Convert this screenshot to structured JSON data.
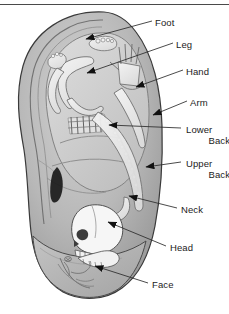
{
  "figure": {
    "top_rule_color": "#4a4a4a",
    "background_color": "#ffffff",
    "ear_fill_color": "#b9b9b9",
    "ear_outline_color": "#3a3a3a",
    "inner_fill_color": "#d6d6d6",
    "fetus_fill_color": "#ededed",
    "shadow_color": "#8e8e8e",
    "arrow_color": "#111111",
    "leader_color": "#2b2b2b",
    "text_color": "#1c1c1c"
  },
  "labels": [
    {
      "id": "foot",
      "text": "Foot",
      "x": 155,
      "y": 17,
      "two_line": false
    },
    {
      "id": "leg",
      "text": "Leg",
      "x": 176,
      "y": 39,
      "two_line": false
    },
    {
      "id": "hand",
      "text": "Hand",
      "x": 186,
      "y": 66,
      "two_line": false
    },
    {
      "id": "arm",
      "text": "Arm",
      "x": 190,
      "y": 97,
      "two_line": false
    },
    {
      "id": "lower-back",
      "line1": "Lower",
      "line2": "Back",
      "x": 186,
      "y": 124,
      "two_line": true
    },
    {
      "id": "upper-back",
      "line1": "Upper",
      "line2": "Back",
      "x": 186,
      "y": 158,
      "two_line": true
    },
    {
      "id": "neck",
      "text": "Neck",
      "x": 181,
      "y": 204,
      "two_line": false
    },
    {
      "id": "head",
      "text": "Head",
      "x": 170,
      "y": 242,
      "two_line": false
    },
    {
      "id": "face",
      "text": "Face",
      "x": 152,
      "y": 279,
      "two_line": false
    }
  ],
  "leaders": [
    {
      "id": "foot",
      "x1": 152,
      "y1": 21,
      "x2": 84,
      "y2": 39
    },
    {
      "id": "leg",
      "x1": 173,
      "y1": 43,
      "x2": 85,
      "y2": 73
    },
    {
      "id": "hand",
      "x1": 183,
      "y1": 70,
      "x2": 135,
      "y2": 87
    },
    {
      "id": "arm",
      "x1": 187,
      "y1": 101,
      "x2": 151,
      "y2": 115
    },
    {
      "id": "lower-back",
      "x1": 181,
      "y1": 128,
      "x2": 107,
      "y2": 125
    },
    {
      "id": "upper-back",
      "x1": 181,
      "y1": 162,
      "x2": 144,
      "y2": 166
    },
    {
      "id": "neck",
      "x1": 177,
      "y1": 208,
      "x2": 127,
      "y2": 196
    },
    {
      "id": "head",
      "x1": 166,
      "y1": 246,
      "x2": 106,
      "y2": 222
    },
    {
      "id": "face",
      "x1": 148,
      "y1": 283,
      "x2": 93,
      "y2": 267
    }
  ],
  "arrows": [
    {
      "id": "foot",
      "tip_x": 79,
      "tip_y": 40,
      "angle": 200
    },
    {
      "id": "leg",
      "tip_x": 80,
      "tip_y": 74,
      "angle": 198
    },
    {
      "id": "hand",
      "tip_x": 128,
      "tip_y": 88,
      "angle": 192
    },
    {
      "id": "arm",
      "tip_x": 146,
      "tip_y": 116,
      "angle": 194
    },
    {
      "id": "lower-back",
      "tip_x": 101,
      "tip_y": 125,
      "angle": 182
    },
    {
      "id": "upper-back",
      "tip_x": 138,
      "tip_y": 167,
      "angle": 186
    },
    {
      "id": "neck",
      "tip_x": 122,
      "tip_y": 195,
      "angle": 166
    },
    {
      "id": "head",
      "tip_x": 100,
      "tip_y": 220,
      "angle": 170
    },
    {
      "id": "face",
      "tip_x": 87,
      "tip_y": 265,
      "angle": 165
    }
  ]
}
